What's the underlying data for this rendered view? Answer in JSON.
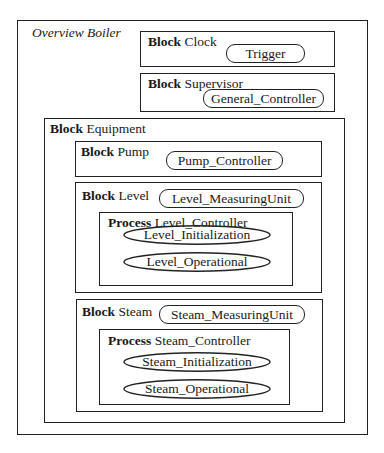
{
  "diagram": {
    "title": "Overview Boiler",
    "keywords": {
      "block": "Block",
      "process": "Process"
    },
    "blocks": {
      "clock": {
        "name": "Clock",
        "items": [
          "Trigger"
        ]
      },
      "supervisor": {
        "name": "Supervisor",
        "items": [
          "General_Controller"
        ]
      },
      "equipment": {
        "name": "Equipment",
        "pump": {
          "name": "Pump",
          "items": [
            "Pump_Controller"
          ]
        },
        "level": {
          "name": "Level",
          "items": [
            "Level_MeasuringUnit"
          ],
          "process": {
            "name": "Level_Controller",
            "states": [
              "Level_Initialization",
              "Level_Operational"
            ]
          }
        },
        "steam": {
          "name": "Steam",
          "items": [
            "Steam_MeasuringUnit"
          ],
          "process": {
            "name": "Steam_Controller",
            "states": [
              "Steam_Initialization",
              "Steam_Operational"
            ]
          }
        }
      }
    }
  }
}
